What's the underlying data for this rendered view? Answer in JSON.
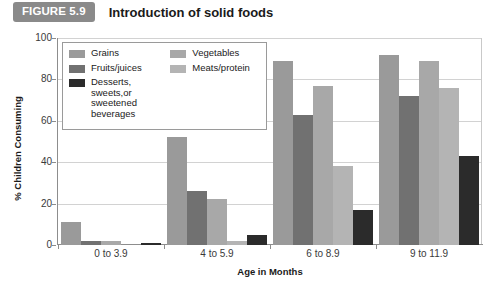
{
  "figure": {
    "badge": "FIGURE 5.9",
    "title": "Introduction of solid foods"
  },
  "chart_data": {
    "type": "bar",
    "title": "Introduction of solid foods",
    "xlabel": "Age in Months",
    "ylabel": "% Children Consuming",
    "categories": [
      "0 to 3.9",
      "4 to 5.9",
      "6 to 8.9",
      "9 to 11.9"
    ],
    "ylim": [
      0,
      100
    ],
    "yticks": [
      0,
      20,
      40,
      60,
      80,
      100
    ],
    "grid": true,
    "legend_position": "upper-left-inside",
    "series": [
      {
        "name": "Grains",
        "color": "#9a9a9a",
        "values": [
          11,
          52,
          89,
          92
        ]
      },
      {
        "name": "Fruits/juices",
        "color": "#717171",
        "values": [
          2,
          26,
          63,
          72
        ]
      },
      {
        "name": "Vegetables",
        "color": "#a8a8a8",
        "values": [
          2,
          22,
          77,
          89
        ]
      },
      {
        "name": "Meats/protein",
        "color": "#b4b4b4",
        "values": [
          0,
          2,
          38,
          76
        ]
      },
      {
        "name": "Desserts, sweets,or sweetened beverages",
        "color": "#2b2b2b",
        "values": [
          1,
          5,
          17,
          43
        ]
      }
    ],
    "legend_labels": [
      {
        "name": "Grains",
        "line1": "Grains",
        "line2": ""
      },
      {
        "name": "Fruits/juices",
        "line1": "Fruits/juices",
        "line2": ""
      },
      {
        "name": "Desserts",
        "line1": "Desserts, sweets,or",
        "line2": "sweetened beverages"
      },
      {
        "name": "Vegetables",
        "line1": "Vegetables",
        "line2": ""
      },
      {
        "name": "Meats/protein",
        "line1": "Meats/protein",
        "line2": ""
      }
    ]
  }
}
